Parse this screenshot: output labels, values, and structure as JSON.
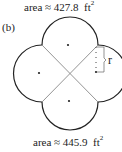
{
  "figure": {
    "panel_label": "(b)",
    "top_area": {
      "prefix": "area ≈ ",
      "value": "427.8",
      "unit": "ft",
      "exponent": "2"
    },
    "bottom_area": {
      "prefix": "area ≈ ",
      "value": "445.9",
      "unit": "ft",
      "exponent": "2"
    },
    "radius_label": "r",
    "shape": "four-overlapping-circular-arcs-with-diagonals",
    "colors": {
      "outline": "#222222",
      "diagonal": "#888888",
      "dots": "#222222"
    }
  }
}
